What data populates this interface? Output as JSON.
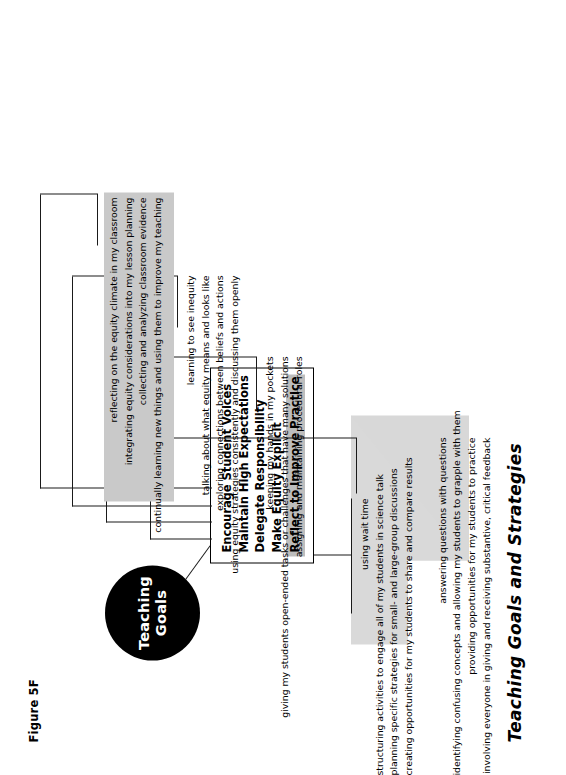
{
  "figure": {
    "label": "Figure 5F",
    "title": "Teaching Goals and Strategies"
  },
  "hub": {
    "line1": "Teaching",
    "line2": "Goals",
    "color": "#000000"
  },
  "goals": [
    {
      "label": "Encourage Student Voices",
      "highlighted": false
    },
    {
      "label": "Maintain High Expectations",
      "highlighted": false
    },
    {
      "label": "Delegate Responsibility",
      "highlighted": false
    },
    {
      "label": "Make Equity Explicit",
      "highlighted": false
    },
    {
      "label": "Reflect to Improve Practice",
      "highlighted": true
    }
  ],
  "highlight_color": "#bdbdbd",
  "strategy_groups": [
    {
      "goal": "Encourage Student Voices",
      "lines": [
        "using wait time",
        "structuring activities to engage all of my students in science talk",
        "planning specific strategies for small- and large-group discussions",
        "creating opportunities for my students to share and compare results"
      ]
    },
    {
      "goal": "Maintain High Expectations",
      "lines": [
        "answering questions with questions",
        "identifying confusing concepts and allowing my students to grapple with them",
        "providing opportunities for my students to practice",
        "involving everyone in giving and receiving substantive, critical feedback"
      ]
    },
    {
      "goal": "Delegate Responsibility",
      "lines": [
        "keeping my hands in my pockets",
        "giving my students open-ended tasks or challenges that have many solutions",
        "assigning and maintaining procedural roles"
      ]
    },
    {
      "goal": "Make Equity Explicit",
      "lines": [
        "learning to see inequity",
        "talking about what equity means and looks like",
        "exploring connections between beliefs and actions",
        "using equity strategies consistently and discussing them openly"
      ]
    },
    {
      "goal": "Reflect to Improve Practice",
      "highlighted": true,
      "lines": [
        "reflecting on the equity climate in my classroom",
        "integrating equity considerations into my lesson planning",
        "collecting and analyzing classroom evidence",
        "continually learning new things and using them to improve my teaching"
      ]
    }
  ]
}
